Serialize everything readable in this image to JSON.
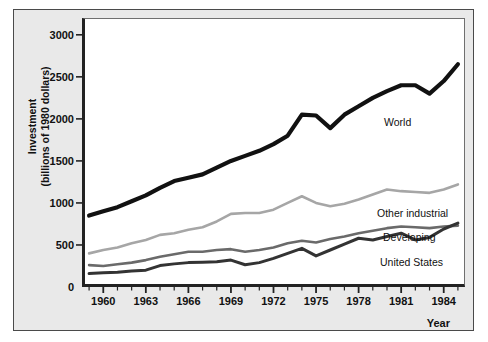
{
  "figure": {
    "background": "#e9e9e9",
    "plot_background": "#ffffff",
    "axis_color": "#222222"
  },
  "axis": {
    "y_title_line1": "Investment",
    "y_title_line2": "(billions of 1980 dollars)",
    "x_title": "Year",
    "y_ticks": [
      "0",
      "500",
      "1000",
      "1500",
      "2000",
      "2500",
      "3000"
    ],
    "x_ticks": [
      "1960",
      "1963",
      "1966",
      "1969",
      "1972",
      "1975",
      "1978",
      "1981",
      "1984"
    ]
  },
  "series_labels": {
    "world": "World",
    "other_industrial": "Other industrial",
    "developing": "Developing",
    "united_states": "United States"
  },
  "chart_data": {
    "type": "line",
    "title": "",
    "xlabel": "Year",
    "ylabel": "Investment (billions of 1980 dollars)",
    "xlim": [
      1958.5,
      1985.5
    ],
    "ylim": [
      0,
      3200
    ],
    "yticks": [
      0,
      500,
      1000,
      1500,
      2000,
      2500,
      3000
    ],
    "xticks": [
      1960,
      1963,
      1966,
      1969,
      1972,
      1975,
      1978,
      1981,
      1984
    ],
    "grid": false,
    "legend": "inline-labels",
    "x": [
      1959,
      1960,
      1961,
      1962,
      1963,
      1964,
      1965,
      1966,
      1967,
      1968,
      1969,
      1970,
      1971,
      1972,
      1973,
      1974,
      1975,
      1976,
      1977,
      1978,
      1979,
      1980,
      1981,
      1982,
      1983,
      1984,
      1985
    ],
    "series": [
      {
        "name": "World",
        "color": "#111111",
        "width": 4.2,
        "values": [
          850,
          900,
          950,
          1020,
          1090,
          1180,
          1260,
          1300,
          1340,
          1420,
          1500,
          1560,
          1620,
          1700,
          1800,
          2050,
          2040,
          1890,
          2050,
          2150,
          2250,
          2330,
          2400,
          2400,
          2300,
          2450,
          2650
        ]
      },
      {
        "name": "Other industrial",
        "color": "#a6a6a6",
        "width": 2.6,
        "values": [
          400,
          440,
          470,
          520,
          560,
          620,
          640,
          680,
          710,
          780,
          870,
          880,
          880,
          920,
          1000,
          1080,
          1000,
          960,
          990,
          1040,
          1100,
          1160,
          1140,
          1130,
          1120,
          1160,
          1220
        ]
      },
      {
        "name": "Developing",
        "color": "#6a6a6a",
        "width": 2.6,
        "values": [
          260,
          250,
          270,
          290,
          320,
          360,
          390,
          420,
          420,
          440,
          450,
          420,
          440,
          470,
          520,
          550,
          530,
          570,
          600,
          640,
          670,
          700,
          720,
          710,
          700,
          720,
          730
        ]
      },
      {
        "name": "United States",
        "color": "#333333",
        "width": 3.0,
        "values": [
          160,
          170,
          175,
          190,
          200,
          255,
          275,
          290,
          295,
          300,
          320,
          265,
          290,
          340,
          400,
          460,
          370,
          440,
          510,
          580,
          560,
          600,
          640,
          560,
          590,
          690,
          760
        ]
      }
    ]
  },
  "label_positions": {
    "world": {
      "left": 384,
      "top": 116
    },
    "other_industrial": {
      "left": 377,
      "top": 207
    },
    "developing": {
      "left": 383,
      "top": 231
    },
    "united_states": {
      "left": 380,
      "top": 256
    }
  }
}
